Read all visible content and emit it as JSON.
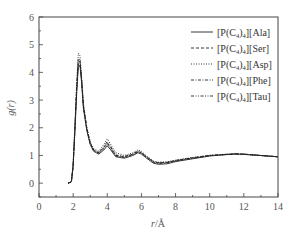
{
  "chart_data": {
    "type": "line",
    "title": "",
    "xlabel": "r/Å",
    "ylabel": "g(r)",
    "xlim": [
      0,
      14
    ],
    "ylim": [
      -0.5,
      6
    ],
    "xticks": [
      0,
      2,
      4,
      6,
      8,
      10,
      12,
      14
    ],
    "yticks": [
      0,
      1,
      2,
      3,
      4,
      5,
      6
    ],
    "grid": false,
    "legend_position": "upper right",
    "series": [
      {
        "name": "[P(C4)4][Ala]",
        "style": "solid",
        "x": [
          1.7,
          1.9,
          2.0,
          2.1,
          2.2,
          2.3,
          2.4,
          2.5,
          2.6,
          2.8,
          3.0,
          3.2,
          3.5,
          3.8,
          4.0,
          4.2,
          4.5,
          5.0,
          5.5,
          5.8,
          6.0,
          6.3,
          6.7,
          7.0,
          7.5,
          8.0,
          9.0,
          10.0,
          11.0,
          11.5,
          12.0,
          13.0,
          14.0
        ],
        "y": [
          0.0,
          0.05,
          0.6,
          1.8,
          3.2,
          4.2,
          4.25,
          3.6,
          2.7,
          1.9,
          1.4,
          1.15,
          1.05,
          1.2,
          1.35,
          1.2,
          0.95,
          0.9,
          1.0,
          1.1,
          1.05,
          0.9,
          0.72,
          0.68,
          0.7,
          0.78,
          0.88,
          0.98,
          1.03,
          1.05,
          1.04,
          1.0,
          0.95
        ]
      },
      {
        "name": "[P(C4)4][Ser]",
        "style": "dashed",
        "x": [
          1.7,
          1.9,
          2.0,
          2.1,
          2.2,
          2.3,
          2.4,
          2.5,
          2.6,
          2.8,
          3.0,
          3.2,
          3.5,
          3.8,
          4.0,
          4.2,
          4.5,
          5.0,
          5.5,
          5.8,
          6.0,
          6.3,
          6.7,
          7.0,
          7.5,
          8.0,
          9.0,
          10.0,
          11.0,
          11.5,
          12.0,
          13.0,
          14.0
        ],
        "y": [
          0.0,
          0.05,
          0.6,
          1.9,
          3.4,
          4.4,
          4.4,
          3.7,
          2.8,
          2.0,
          1.45,
          1.2,
          1.1,
          1.3,
          1.45,
          1.3,
          1.0,
          0.95,
          1.05,
          1.15,
          1.1,
          0.95,
          0.78,
          0.74,
          0.75,
          0.82,
          0.92,
          1.0,
          1.04,
          1.06,
          1.05,
          1.0,
          0.95
        ]
      },
      {
        "name": "[P(C4)4][Asp]",
        "style": "dotted",
        "x": [
          1.7,
          1.9,
          2.0,
          2.1,
          2.2,
          2.3,
          2.4,
          2.5,
          2.6,
          2.8,
          3.0,
          3.2,
          3.5,
          3.8,
          4.0,
          4.2,
          4.5,
          5.0,
          5.5,
          5.8,
          6.0,
          6.3,
          6.7,
          7.0,
          7.5,
          8.0,
          9.0,
          10.0,
          11.0,
          11.5,
          12.0,
          13.0,
          14.0
        ],
        "y": [
          0.0,
          0.05,
          0.7,
          2.0,
          3.6,
          4.7,
          4.6,
          3.8,
          2.9,
          2.0,
          1.5,
          1.25,
          1.15,
          1.4,
          1.6,
          1.4,
          1.1,
          1.0,
          1.1,
          1.2,
          1.15,
          0.98,
          0.8,
          0.76,
          0.77,
          0.83,
          0.93,
          1.01,
          1.05,
          1.06,
          1.05,
          1.0,
          0.95
        ]
      },
      {
        "name": "[P(C4)4][Phe]",
        "style": "dash-dot",
        "x": [
          1.7,
          1.9,
          2.0,
          2.1,
          2.2,
          2.3,
          2.4,
          2.5,
          2.6,
          2.8,
          3.0,
          3.2,
          3.5,
          3.8,
          4.0,
          4.2,
          4.5,
          5.0,
          5.5,
          5.8,
          6.0,
          6.3,
          6.7,
          7.0,
          7.5,
          8.0,
          9.0,
          10.0,
          11.0,
          11.5,
          12.0,
          13.0,
          14.0
        ],
        "y": [
          0.0,
          0.05,
          0.6,
          1.85,
          3.3,
          4.3,
          4.35,
          3.65,
          2.75,
          1.95,
          1.42,
          1.18,
          1.08,
          1.25,
          1.4,
          1.25,
          0.98,
          0.93,
          1.03,
          1.12,
          1.08,
          0.93,
          0.75,
          0.71,
          0.73,
          0.8,
          0.9,
          0.99,
          1.04,
          1.05,
          1.04,
          1.0,
          0.95
        ]
      },
      {
        "name": "[P(C4)4][Tau]",
        "style": "dash-dot-dot",
        "x": [
          1.7,
          1.9,
          2.0,
          2.1,
          2.2,
          2.3,
          2.4,
          2.5,
          2.6,
          2.8,
          3.0,
          3.2,
          3.5,
          3.8,
          4.0,
          4.2,
          4.5,
          5.0,
          5.5,
          5.8,
          6.0,
          6.3,
          6.7,
          7.0,
          7.5,
          8.0,
          9.0,
          10.0,
          11.0,
          11.5,
          12.0,
          13.0,
          14.0
        ],
        "y": [
          0.0,
          0.05,
          0.65,
          1.9,
          3.4,
          4.5,
          4.45,
          3.7,
          2.8,
          1.98,
          1.46,
          1.2,
          1.1,
          1.32,
          1.5,
          1.32,
          1.02,
          0.96,
          1.06,
          1.16,
          1.1,
          0.95,
          0.77,
          0.73,
          0.75,
          0.81,
          0.91,
          1.0,
          1.04,
          1.06,
          1.05,
          1.0,
          0.95
        ]
      }
    ]
  },
  "legend": {
    "items": [
      {
        "label": "[P(C4)4][Ala]",
        "base": "[P(C",
        "sub1": "4",
        "mid": ")",
        "sub2": "4",
        "tail": "][Ala]"
      },
      {
        "label": "[P(C4)4][Ser]",
        "base": "[P(C",
        "sub1": "4",
        "mid": ")",
        "sub2": "4",
        "tail": "][Ser]"
      },
      {
        "label": "[P(C4)4][Asp]",
        "base": "[P(C",
        "sub1": "4",
        "mid": ")",
        "sub2": "4",
        "tail": "][Asp]"
      },
      {
        "label": "[P(C4)4][Phe]",
        "base": "[P(C",
        "sub1": "4",
        "mid": ")",
        "sub2": "4",
        "tail": "][Phe]"
      },
      {
        "label": "[P(C4)4][Tau]",
        "base": "[P(C",
        "sub1": "4",
        "mid": ")",
        "sub2": "4",
        "tail": "][Tau]"
      }
    ]
  },
  "axes": {
    "xlabel_italic": "r",
    "xlabel_rest": "/Å",
    "ylabel": "g(r)"
  },
  "colors": {
    "axis": "#444444",
    "line": "#222222",
    "text": "#555555"
  }
}
